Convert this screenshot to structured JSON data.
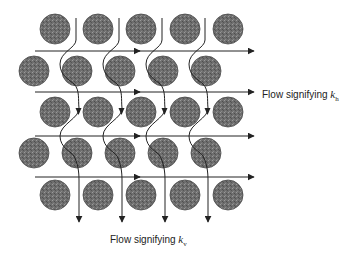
{
  "diagram": {
    "grain_color": "#6e6e6e",
    "grain_stroke": "#4a4a4a",
    "line_color": "#222222",
    "grain_radius": 15,
    "grain_rows": [
      {
        "y": 29,
        "x": [
          55,
          98,
          141,
          185,
          228
        ]
      },
      {
        "y": 71,
        "x": [
          34,
          77,
          120,
          163,
          206
        ]
      },
      {
        "y": 112,
        "x": [
          55,
          98,
          141,
          185,
          228
        ]
      },
      {
        "y": 153,
        "x": [
          34,
          77,
          120,
          163,
          206
        ]
      },
      {
        "y": 195,
        "x": [
          55,
          98,
          141,
          185,
          228
        ]
      }
    ],
    "horizontal_flows": [
      51,
      92,
      136,
      177
    ],
    "vertical_flows": [
      76,
      119,
      162,
      205
    ]
  },
  "labels": {
    "horizontal": {
      "prefix": "Flow signifying ",
      "symbol": "k",
      "subscript": "h"
    },
    "vertical": {
      "prefix": "Flow signifying ",
      "symbol": "k",
      "subscript": "v"
    }
  }
}
